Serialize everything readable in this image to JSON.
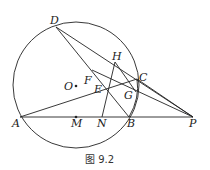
{
  "caption": "图 9.2",
  "points": {
    "A": "A",
    "B": "B",
    "C": "C",
    "D": "D",
    "E": "E",
    "F": "F",
    "G": "G",
    "H": "H",
    "M": "M",
    "N": "N",
    "O": "O",
    "P": "P"
  },
  "colors": {
    "stroke": "#222222",
    "background": "#ffffff"
  }
}
